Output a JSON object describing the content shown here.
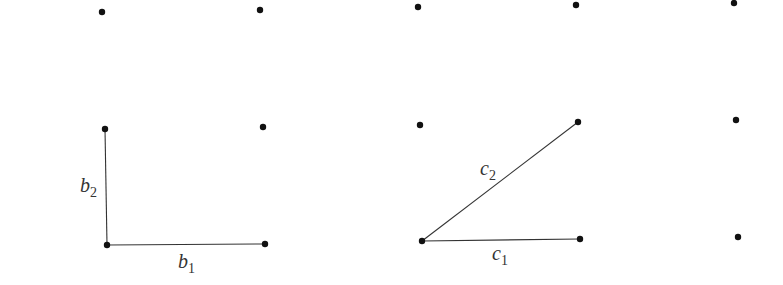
{
  "diagram": {
    "points": [
      {
        "id": "p1",
        "x": 102,
        "y": 12
      },
      {
        "id": "p2",
        "x": 260,
        "y": 10
      },
      {
        "id": "p3",
        "x": 418,
        "y": 7
      },
      {
        "id": "p4",
        "x": 576,
        "y": 5
      },
      {
        "id": "p5",
        "x": 734,
        "y": 3
      },
      {
        "id": "p6",
        "x": 105,
        "y": 129
      },
      {
        "id": "p7",
        "x": 263,
        "y": 127
      },
      {
        "id": "p8",
        "x": 420,
        "y": 125
      },
      {
        "id": "p9",
        "x": 578,
        "y": 122
      },
      {
        "id": "p10",
        "x": 736,
        "y": 120
      },
      {
        "id": "p11",
        "x": 107,
        "y": 245
      },
      {
        "id": "p12",
        "x": 265,
        "y": 244
      },
      {
        "id": "p13",
        "x": 422,
        "y": 241
      },
      {
        "id": "p14",
        "x": 580,
        "y": 239
      },
      {
        "id": "p15",
        "x": 738,
        "y": 237
      }
    ],
    "basis_b": {
      "b1": {
        "label": "b",
        "subscript": "1",
        "from": [
          107,
          245
        ],
        "to": [
          265,
          244
        ],
        "label_pos": [
          178,
          268
        ]
      },
      "b2": {
        "label": "b",
        "subscript": "2",
        "from": [
          107,
          245
        ],
        "to": [
          105,
          129
        ],
        "label_pos": [
          80,
          192
        ]
      }
    },
    "basis_c": {
      "c1": {
        "label": "c",
        "subscript": "1",
        "from": [
          422,
          241
        ],
        "to": [
          580,
          239
        ],
        "label_pos": [
          492,
          260
        ]
      },
      "c2": {
        "label": "c",
        "subscript": "2",
        "from": [
          422,
          241
        ],
        "to": [
          578,
          122
        ],
        "label_pos": [
          480,
          175
        ]
      }
    },
    "colors": {
      "dot": "#111111",
      "line": "#333333",
      "background": "#ffffff"
    }
  }
}
